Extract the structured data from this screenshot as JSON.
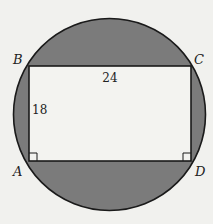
{
  "figure": {
    "colors": {
      "background": "#f1f1ee",
      "shaded_region": "#7b7b7b",
      "rectangle_fill": "#f3f3f0",
      "stroke": "#1a1a1a"
    },
    "circle": {
      "cx": 109.5,
      "cy": 114.5,
      "r": 96
    },
    "rectangle": {
      "x": 29,
      "y": 66,
      "width": 162,
      "height": 95
    },
    "vertices": [
      {
        "label": "B",
        "x": 29,
        "y": 66,
        "label_x": 13,
        "label_y": 64
      },
      {
        "label": "C",
        "x": 191,
        "y": 66,
        "label_x": 194,
        "label_y": 64
      },
      {
        "label": "A",
        "x": 29,
        "y": 161,
        "label_x": 13,
        "label_y": 176
      },
      {
        "label": "D",
        "x": 191,
        "y": 161,
        "label_x": 195,
        "label_y": 176
      }
    ],
    "dimensions": {
      "top_side": {
        "text": "24",
        "x": 110,
        "y": 82
      },
      "left_side": {
        "text": "18",
        "x": 32,
        "y": 114
      }
    },
    "right_angle_markers": [
      "A",
      "D"
    ]
  }
}
